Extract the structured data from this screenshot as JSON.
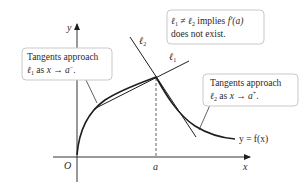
{
  "diagram": {
    "type": "calculus-tangent-illustration",
    "axes": {
      "x_label": "x",
      "y_label": "y",
      "origin_label": "O",
      "tick_label_a": "a"
    },
    "curve": {
      "label": "y = f(x)"
    },
    "lines": {
      "l1_label": "ℓ",
      "l1_sub": "1",
      "l2_label": "ℓ",
      "l2_sub": "2"
    },
    "callouts": {
      "top": {
        "line1_a": "ℓ",
        "line1_sub1": "1",
        "line1_neq": " ≠ ",
        "line1_b": "ℓ",
        "line1_sub2": "2",
        "line1_rest": " implies ",
        "line1_fn": "f′(a)",
        "line2": "does not exist."
      },
      "left": {
        "line1": "Tangents approach",
        "line2_l": "ℓ",
        "line2_sub": "1",
        "line2_rest": " as ",
        "line2_x": "x",
        "line2_arrow": " → ",
        "line2_a": "a",
        "line2_sup": "−",
        "line2_end": "."
      },
      "right": {
        "line1": "Tangents approach",
        "line2_l": "ℓ",
        "line2_sub": "2",
        "line2_rest": " as ",
        "line2_x": "x",
        "line2_arrow": " → ",
        "line2_a": "a",
        "line2_sup": "+",
        "line2_end": "."
      }
    },
    "colors": {
      "ink": "#1e1e1e",
      "box_border": "#c9c9c9",
      "background": "#ffffff"
    }
  }
}
